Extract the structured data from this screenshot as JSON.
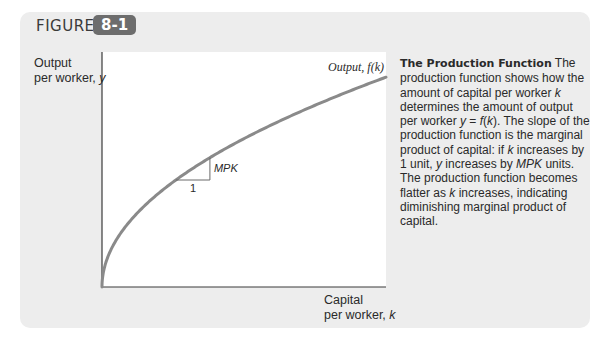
{
  "figure": {
    "label": "FIGURE",
    "number": "8-1"
  },
  "caption": {
    "title": "The Production Function",
    "text_parts": [
      {
        "t": " The production function shows how the amount of capital per worker ",
        "i": false
      },
      {
        "t": "k",
        "i": true
      },
      {
        "t": " determines the amount of output per worker ",
        "i": false
      },
      {
        "t": "y",
        "i": true
      },
      {
        "t": " = ",
        "i": false
      },
      {
        "t": "f",
        "i": true
      },
      {
        "t": "(",
        "i": false
      },
      {
        "t": "k",
        "i": true
      },
      {
        "t": "). The slope of the production function is the marginal product of capital: if ",
        "i": false
      },
      {
        "t": "k",
        "i": true
      },
      {
        "t": " increases by 1 unit, ",
        "i": false
      },
      {
        "t": "y",
        "i": true
      },
      {
        "t": " increases by ",
        "i": false
      },
      {
        "t": "MPK",
        "i": true
      },
      {
        "t": " units. The production function becomes flatter as ",
        "i": false
      },
      {
        "t": "k",
        "i": true
      },
      {
        "t": " increases, indicating diminishing marginal product of capital.",
        "i": false
      }
    ]
  },
  "colors": {
    "curve": "#8a8a8a",
    "axis": "#3a3a3a",
    "panel": "#ededed",
    "badge": "#6d6d6d"
  },
  "chart_data": {
    "type": "line",
    "title": "The Production Function",
    "xlabel_line1": "Capital",
    "xlabel_line2": "per worker, ",
    "xlabel_var": "k",
    "ylabel_line1": "Output",
    "ylabel_line2": "per worker, ",
    "ylabel_var": "y",
    "series": [
      {
        "name": "Output, f(k)",
        "label": "Output, f(k)",
        "function": "sqrt",
        "x": [
          0,
          0.01,
          0.05,
          0.1,
          0.2,
          0.3,
          0.4,
          0.5,
          0.6,
          0.7,
          0.8,
          0.9,
          1.0
        ],
        "y": [
          0,
          0.1,
          0.224,
          0.316,
          0.447,
          0.548,
          0.632,
          0.707,
          0.775,
          0.837,
          0.894,
          0.949,
          1.0
        ]
      }
    ],
    "annotations": {
      "slope_triangle": {
        "run_label": "1",
        "rise_label": "MPK",
        "x_start": 0.26,
        "x_end": 0.38
      }
    },
    "xlim": [
      0,
      1
    ],
    "ylim": [
      0,
      1.12
    ],
    "ticks": false,
    "grid": false
  }
}
